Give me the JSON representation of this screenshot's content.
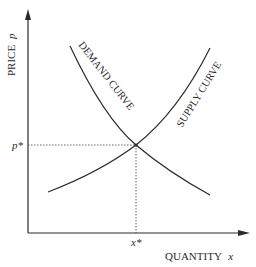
{
  "diagram": {
    "type": "supply-demand",
    "y_axis": {
      "label": "PRICE",
      "variable": "p"
    },
    "x_axis": {
      "label": "QUANTITY",
      "variable": "x"
    },
    "curves": [
      {
        "name": "demand",
        "label": "DEMAND CURVE",
        "slope": "downward"
      },
      {
        "name": "supply",
        "label": "SUPPLY CURVE",
        "slope": "upward"
      }
    ],
    "equilibrium": {
      "price_label": "p*",
      "quantity_label": "x*"
    },
    "colors": {
      "line": "#2a2a2a",
      "background": "#ffffff",
      "guide": "#555555"
    }
  }
}
